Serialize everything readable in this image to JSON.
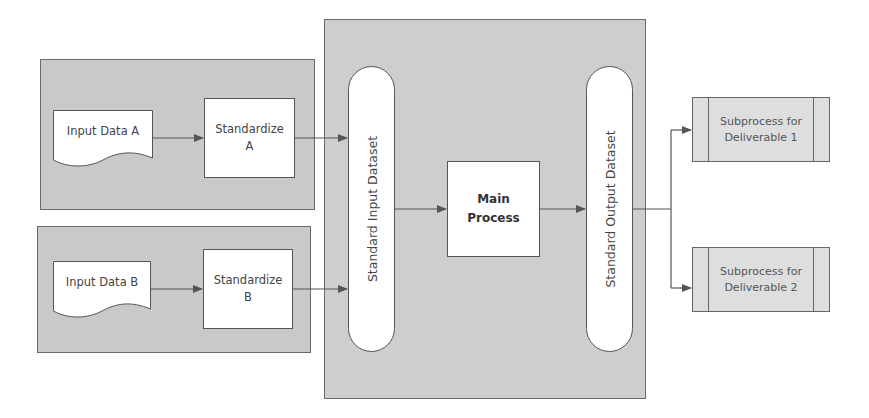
{
  "diagram": {
    "panels": {
      "input_a": {
        "doc_label": "Input Data A",
        "process_label_line1": "Standardize",
        "process_label_line2": "A"
      },
      "input_b": {
        "doc_label": "Input Data B",
        "process_label_line1": "Standardize",
        "process_label_line2": "B"
      }
    },
    "main": {
      "input_dataset_label": "Standard Input Dataset",
      "process_label_line1": "Main",
      "process_label_line2": "Process",
      "output_dataset_label": "Standard Output Dataset"
    },
    "subprocesses": [
      {
        "line1": "Subprocess for",
        "line2": "Deliverable 1"
      },
      {
        "line1": "Subprocess for",
        "line2": "Deliverable 2"
      }
    ],
    "colors": {
      "panel_fill": "#c9c9c9",
      "main_panel_fill": "#cecece",
      "subprocess_fill": "#dedede",
      "line": "#555555",
      "node_fill": "#ffffff"
    }
  }
}
